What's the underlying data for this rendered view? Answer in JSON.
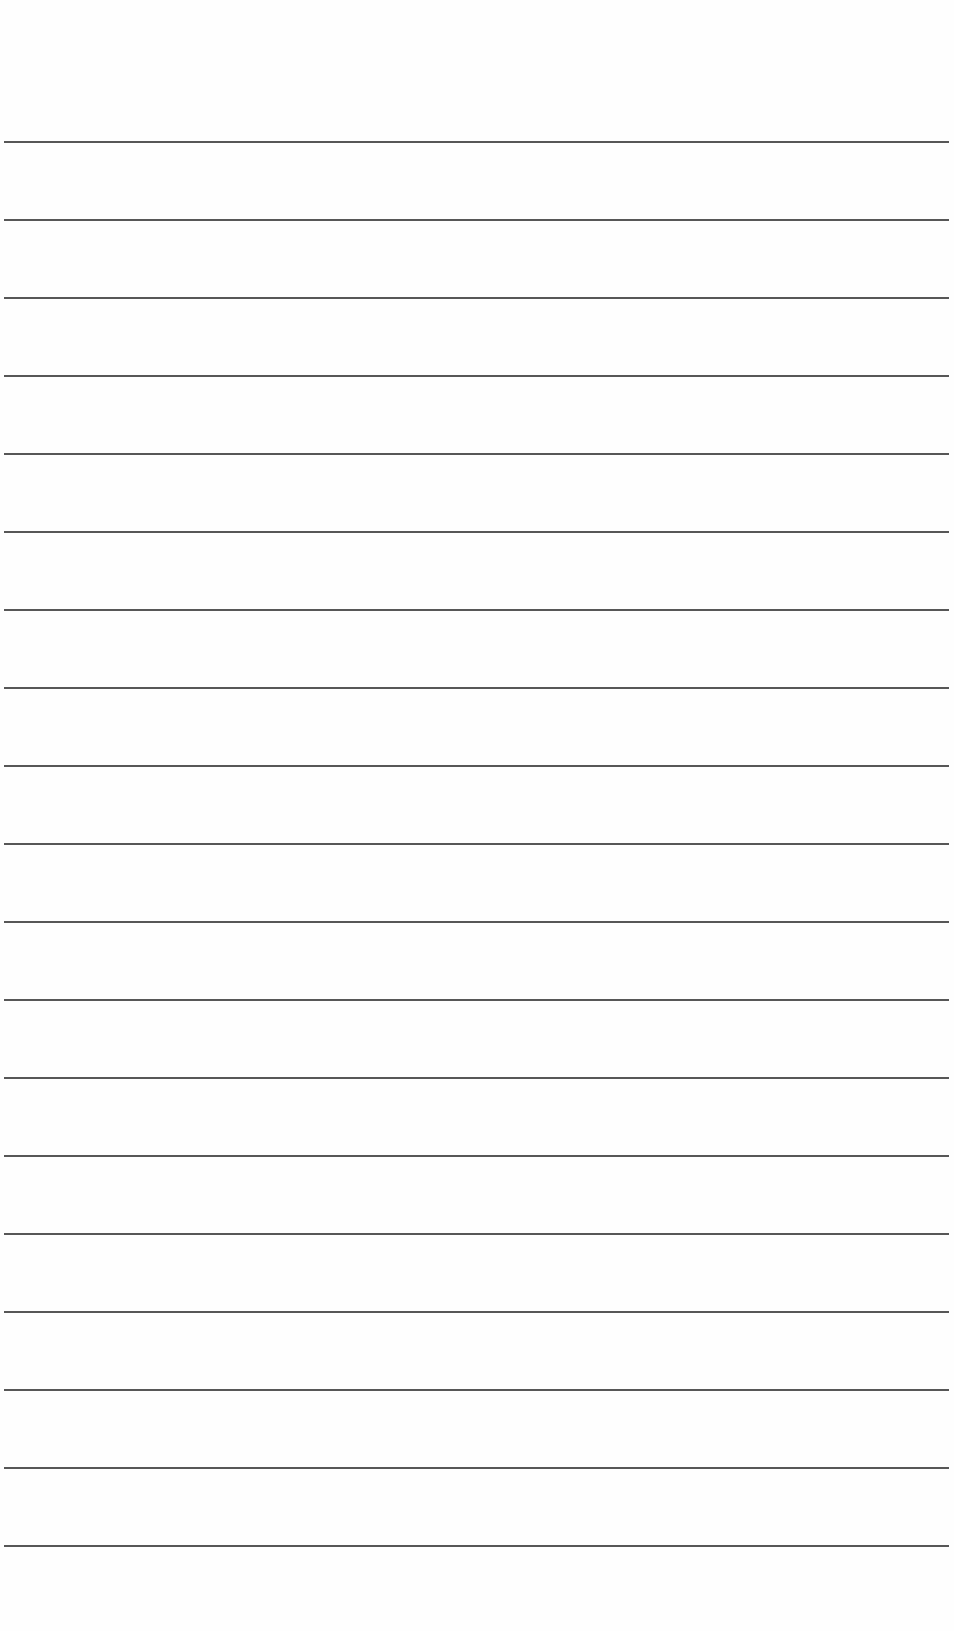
{
  "page": {
    "type": "lined-paper",
    "background_color": "#fefefe",
    "line_color": "#3a3a3a",
    "line_count": 19,
    "first_line_y": 141,
    "line_spacing": 78,
    "line_left": 4,
    "line_width": 945,
    "text_content": []
  }
}
